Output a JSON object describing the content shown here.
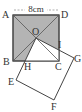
{
  "diagram": {
    "dimension_label": "8cm",
    "labels": {
      "A": "A",
      "B": "B",
      "C": "C",
      "D": "D",
      "O": "O",
      "E": "E",
      "F": "F",
      "G": "G",
      "H": "H",
      "I": "I"
    },
    "colors": {
      "shade": "#b4b4b4",
      "line": "#444444",
      "background": "#ffffff"
    }
  }
}
